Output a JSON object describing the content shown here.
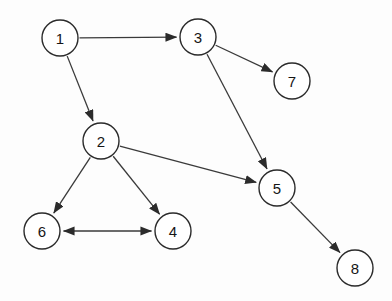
{
  "diagram": {
    "type": "directed-graph",
    "background_color": "#fdfdfd",
    "node_fill_color": "#ffffff",
    "node_stroke_color": "#2b2b2b",
    "edge_color": "#3a3a3a",
    "label_color": "#161616",
    "node_radius": 18,
    "canvas": {
      "width": 392,
      "height": 301
    },
    "nodes": [
      {
        "id": "1",
        "label": "1",
        "x": 60,
        "y": 38
      },
      {
        "id": "2",
        "label": "2",
        "x": 101,
        "y": 141
      },
      {
        "id": "3",
        "label": "3",
        "x": 198,
        "y": 37
      },
      {
        "id": "4",
        "label": "4",
        "x": 173,
        "y": 231
      },
      {
        "id": "5",
        "label": "5",
        "x": 277,
        "y": 188
      },
      {
        "id": "6",
        "label": "6",
        "x": 42,
        "y": 231
      },
      {
        "id": "7",
        "label": "7",
        "x": 292,
        "y": 81
      },
      {
        "id": "8",
        "label": "8",
        "x": 355,
        "y": 268
      }
    ],
    "edges": [
      {
        "from": "1",
        "to": "3",
        "arrow": "forward",
        "label": "1 to 3"
      },
      {
        "from": "1",
        "to": "2",
        "arrow": "forward",
        "label": "1 to 2"
      },
      {
        "from": "3",
        "to": "7",
        "arrow": "forward",
        "label": "3 to 7"
      },
      {
        "from": "3",
        "to": "5",
        "arrow": "forward",
        "label": "3 to 5"
      },
      {
        "from": "2",
        "to": "5",
        "arrow": "forward",
        "label": "2 to 5"
      },
      {
        "from": "2",
        "to": "6",
        "arrow": "forward",
        "label": "2 to 6"
      },
      {
        "from": "2",
        "to": "4",
        "arrow": "forward",
        "label": "2 to 4"
      },
      {
        "from": "6",
        "to": "4",
        "arrow": "both",
        "label": "6 to 4 bidirectional"
      },
      {
        "from": "5",
        "to": "8",
        "arrow": "forward",
        "label": "5 to 8"
      }
    ]
  }
}
